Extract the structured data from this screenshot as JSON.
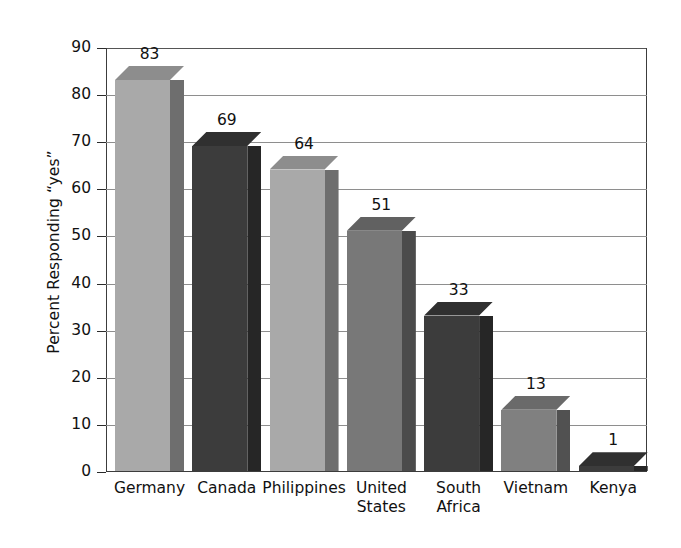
{
  "chart_data": {
    "type": "bar",
    "title": "",
    "subtitle": "",
    "xlabel": "",
    "ylabel": "Percent Responding “yes”",
    "categories": [
      "Germany",
      "Canada",
      "Philippines",
      "United States",
      "South Africa",
      "Vietnam",
      "Kenya"
    ],
    "values": [
      83,
      69,
      64,
      51,
      33,
      13,
      1
    ],
    "ylim": [
      0,
      90
    ],
    "ytick_step": 10,
    "yticks": [
      90,
      80,
      70,
      60,
      50,
      40,
      30,
      20,
      10,
      0
    ],
    "ytick_labels": [
      "90",
      "80",
      "70",
      "60",
      "50",
      "40",
      "30",
      "20",
      "10",
      "0"
    ],
    "grid": true,
    "grid_axis": "y",
    "legend": false,
    "legend_position": "none",
    "data_labels": [
      "83",
      "69",
      "64",
      "51",
      "33",
      "13",
      "1"
    ],
    "style": "3d-column",
    "bar_colors": [
      "#a9a9a9",
      "#3c3c3c",
      "#a9a9a9",
      "#787878",
      "#3c3c3c",
      "#808080",
      "#3c3c3c"
    ],
    "bar_side_colors": [
      "#6e6e6e",
      "#262626",
      "#6e6e6e",
      "#4b4b4b",
      "#262626",
      "#515151",
      "#262626"
    ],
    "bar_top_colors": [
      "#8d8d8d",
      "#303030",
      "#8d8d8d",
      "#616161",
      "#303030",
      "#6a6a6a",
      "#303030"
    ],
    "category_labels_multiline": [
      "Germany",
      "Canada",
      "Philippines",
      "United\nStates",
      "South\nAfrica",
      "Vietnam",
      "Kenya"
    ],
    "background_color": "#ffffff",
    "axis_color": "#3c3c3c",
    "gridline_color": "#8e8e8e",
    "text_color": "#111111"
  }
}
